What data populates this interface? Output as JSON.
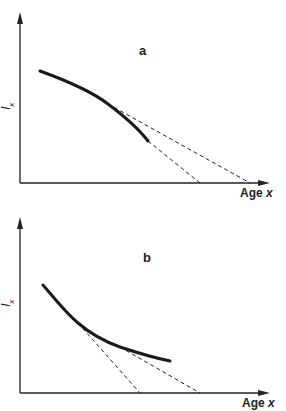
{
  "panels": [
    {
      "id": "a",
      "letter": "a",
      "ylabel": "l",
      "ylabel_sub": "x",
      "xlabel_word": "Age",
      "xlabel_var": "x",
      "curve_shape": "concave (accelerating decline)",
      "curve_points": [
        [
          40,
          71
        ],
        [
          75,
          84
        ],
        [
          108,
          104
        ],
        [
          130,
          122
        ],
        [
          148,
          141
        ]
      ],
      "tangents": [
        {
          "from": [
            108,
            104
          ],
          "to": [
            250,
            183
          ]
        },
        {
          "from": [
            148,
            141
          ],
          "to": [
            200,
            183
          ]
        }
      ]
    },
    {
      "id": "b",
      "letter": "b",
      "ylabel": "l",
      "ylabel_sub": "x",
      "xlabel_word": "Age",
      "xlabel_var": "x",
      "curve_shape": "convex (decelerating decline)",
      "curve_points": [
        [
          43,
          80
        ],
        [
          60,
          100
        ],
        [
          78,
          118
        ],
        [
          100,
          133
        ],
        [
          120,
          142
        ],
        [
          145,
          151
        ],
        [
          170,
          156
        ]
      ],
      "tangents": [
        {
          "from": [
            78,
            118
          ],
          "to": [
            140,
            188
          ]
        },
        {
          "from": [
            120,
            142
          ],
          "to": [
            200,
            188
          ]
        }
      ]
    }
  ],
  "colors": {
    "ink": "#222222",
    "background": "#ffffff"
  }
}
